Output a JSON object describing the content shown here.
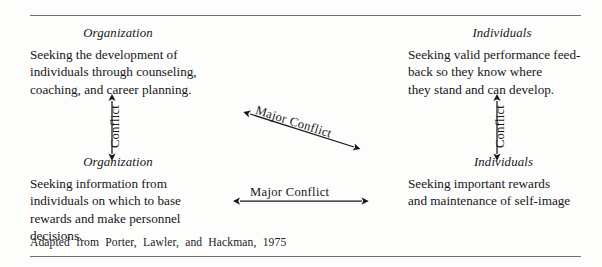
{
  "figure": {
    "type": "conflict-matrix-diagram",
    "rule_color": "#6f6f72",
    "text_color": "#17161a"
  },
  "quadrants": {
    "top_left": {
      "heading": "Organization",
      "body": "Seeking the development of\nindividuals through counseling,\ncoaching, and career planning."
    },
    "top_right": {
      "heading": "Individuals",
      "body": "Seeking valid performance feed-\nback so they know where\nthey stand and can develop."
    },
    "bottom_left": {
      "heading": "Organization",
      "body": "Seeking information from\nindividuals on which to base\nrewards and make personnel\ndecisions."
    },
    "bottom_right": {
      "heading": "Individuals",
      "body": "Seeking important rewards\nand maintenance of self-image"
    }
  },
  "arrows": {
    "left_vertical": {
      "label": "Conflict",
      "orientation": "vertical",
      "heads": "both"
    },
    "right_vertical": {
      "label": "Conflict",
      "orientation": "vertical",
      "heads": "both"
    },
    "diagonal": {
      "label": "Major Conflict",
      "orientation": "diagonal",
      "heads": "both"
    },
    "bottom_horizontal": {
      "label": "Major Conflict",
      "orientation": "horizontal",
      "heads": "both"
    }
  },
  "source": {
    "note": "Adapted from Porter, Lawler, and Hackman, 1975"
  }
}
